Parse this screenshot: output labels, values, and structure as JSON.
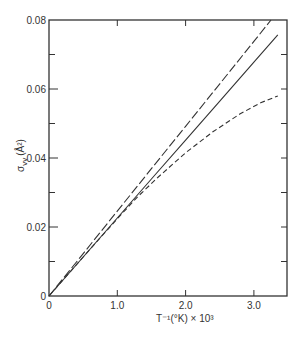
{
  "chart_data": {
    "type": "line",
    "title": "",
    "xlabel": "T⁻¹(°K) × 10³",
    "ylabel": "σvv (Å²)",
    "xlim": [
      0,
      3.5
    ],
    "ylim": [
      0,
      0.08
    ],
    "x_ticks": [
      0,
      1.0,
      2.0,
      3.0
    ],
    "x_tick_labels": [
      "0",
      "1.0",
      "2.0",
      "3.0"
    ],
    "y_ticks": [
      0,
      0.02,
      0.04,
      0.06,
      0.08
    ],
    "y_tick_labels": [
      "0",
      "0.02",
      "0.04",
      "0.06",
      "0.08"
    ],
    "grid": false,
    "legend": null,
    "series": [
      {
        "name": "dash-dot line",
        "style": "dashdot",
        "x": [
          0,
          0.5,
          1.0,
          1.5,
          2.0,
          2.5,
          3.0,
          3.25
        ],
        "y": [
          0,
          0.0123,
          0.0246,
          0.0369,
          0.0492,
          0.0615,
          0.0738,
          0.08
        ]
      },
      {
        "name": "solid line",
        "style": "solid",
        "x": [
          0,
          0.5,
          1.0,
          1.5,
          2.0,
          2.5,
          3.0,
          3.35
        ],
        "y": [
          0,
          0.0113,
          0.0226,
          0.0339,
          0.0452,
          0.0565,
          0.0678,
          0.0757
        ]
      },
      {
        "name": "dashed curve",
        "style": "dashed",
        "x": [
          0,
          0.5,
          1.0,
          1.3,
          1.6,
          2.0,
          2.4,
          2.8,
          3.1,
          3.35
        ],
        "y": [
          0,
          0.0113,
          0.0224,
          0.0288,
          0.0345,
          0.0415,
          0.0476,
          0.0528,
          0.056,
          0.058
        ]
      }
    ]
  },
  "labels": {
    "x_axis": "T⁻¹(°K) × 10³",
    "y_axis_sigma": "σ",
    "y_axis_sub": "vv",
    "y_axis_unit": "(Å²)"
  }
}
